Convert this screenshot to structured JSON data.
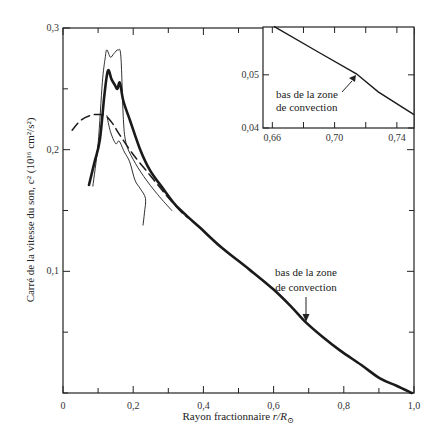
{
  "chart_data": [
    {
      "type": "line",
      "title": "",
      "xlabel": "Rayon fractionnaire r/R⊙",
      "ylabel": "Carré de la vitesse du son, c² (10¹⁶ cm²/s²)",
      "xlim": [
        0,
        1.0
      ],
      "ylim": [
        0,
        0.3
      ],
      "grid": false,
      "x_ticks": [
        0,
        0.1,
        0.2,
        0.3,
        0.4,
        0.5,
        0.6,
        0.7,
        0.8,
        0.9,
        1.0
      ],
      "x_tick_labels": [
        "0",
        "",
        "0,2",
        "",
        "0,4",
        "",
        "0,6",
        "",
        "0,8",
        "",
        "1,0"
      ],
      "y_ticks": [
        0,
        0.05,
        0.1,
        0.15,
        0.2,
        0.25,
        0.3
      ],
      "y_tick_labels": [
        "",
        "",
        "0,1",
        "",
        "0,2",
        "",
        "0,3"
      ],
      "annotations": [
        {
          "text_lines": [
            "bas de la zone",
            "de convection"
          ],
          "x": 0.69,
          "y": 0.058,
          "arrow": "down"
        }
      ],
      "series": [
        {
          "name": "thick-solid",
          "style": "solid-thick",
          "x": [
            0.074,
            0.09,
            0.105,
            0.118,
            0.128,
            0.138,
            0.148,
            0.155,
            0.162,
            0.172,
            0.191,
            0.22,
            0.248,
            0.285,
            0.319,
            0.355,
            0.39,
            0.45,
            0.533,
            0.6,
            0.65,
            0.692,
            0.74,
            0.789,
            0.85,
            0.903,
            0.95,
            0.994
          ],
          "y": [
            0.171,
            0.19,
            0.208,
            0.245,
            0.265,
            0.258,
            0.253,
            0.25,
            0.255,
            0.24,
            0.224,
            0.2,
            0.183,
            0.168,
            0.155,
            0.145,
            0.136,
            0.12,
            0.101,
            0.085,
            0.071,
            0.058,
            0.046,
            0.035,
            0.023,
            0.012,
            0.006,
            0.0
          ]
        },
        {
          "name": "dashed",
          "style": "dashed",
          "x": [
            0.026,
            0.05,
            0.077,
            0.1,
            0.12,
            0.14,
            0.162,
            0.2,
            0.248,
            0.29,
            0.333,
            0.356
          ],
          "y": [
            0.216,
            0.224,
            0.228,
            0.229,
            0.228,
            0.222,
            0.212,
            0.196,
            0.179,
            0.164,
            0.15,
            0.144
          ]
        },
        {
          "name": "thin-solid-1",
          "style": "solid-thin",
          "x": [
            0.085,
            0.1,
            0.112,
            0.12,
            0.125,
            0.135,
            0.145,
            0.157,
            0.165,
            0.172,
            0.18,
            0.2,
            0.23,
            0.27,
            0.31
          ],
          "y": [
            0.17,
            0.205,
            0.255,
            0.275,
            0.282,
            0.276,
            0.279,
            0.282,
            0.276,
            0.225,
            0.205,
            0.192,
            0.178,
            0.163,
            0.15
          ]
        },
        {
          "name": "thin-solid-2",
          "style": "solid-thin",
          "x": [
            0.125,
            0.135,
            0.15,
            0.16,
            0.175,
            0.19,
            0.205,
            0.22,
            0.235,
            0.232,
            0.228
          ],
          "y": [
            0.228,
            0.215,
            0.205,
            0.207,
            0.198,
            0.19,
            0.175,
            0.168,
            0.16,
            0.148,
            0.138
          ]
        }
      ]
    },
    {
      "type": "line",
      "title": "Inset",
      "xlabel": "",
      "ylabel": "",
      "xlim": [
        0.654,
        0.751
      ],
      "ylim": [
        0.04,
        0.059
      ],
      "grid": false,
      "x_ticks": [
        0.66,
        0.68,
        0.7,
        0.72,
        0.74
      ],
      "x_tick_labels": [
        "0,66",
        "",
        "0,70",
        "",
        "0,74"
      ],
      "y_ticks": [
        0.04,
        0.05
      ],
      "y_tick_labels": [
        "0,04",
        "0,05"
      ],
      "annotations": [
        {
          "text_lines": [
            "bas de la zone",
            "de convection"
          ],
          "x": 0.714,
          "y": 0.0502,
          "arrow": "up-right"
        }
      ],
      "series": [
        {
          "name": "inset-curve",
          "style": "solid",
          "x": [
            0.661,
            0.69,
            0.714,
            0.728,
            0.751
          ],
          "y": [
            0.0591,
            0.0542,
            0.0502,
            0.0468,
            0.0425
          ]
        }
      ]
    }
  ],
  "labels": {
    "xlabel_main": "Rayon fractionnaire ",
    "xlabel_italic": "r/R",
    "xlabel_sub": "⊙",
    "ylabel": "Carré de la vitesse du son, c² (10¹⁶ cm²/s²)",
    "annot_line1": "bas de la zone",
    "annot_line2": "de convection",
    "inset_annot_line1": "bas de la zone",
    "inset_annot_line2": "de convection"
  },
  "colors": {
    "ink": "#1a1a1a",
    "axis": "#333333"
  }
}
